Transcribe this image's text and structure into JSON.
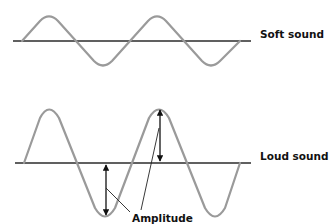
{
  "diagram": {
    "waves": [
      {
        "id": "soft",
        "label": "Soft sound",
        "baseline_y": 41,
        "amplitude_px": 22,
        "cycles": 2,
        "color": "#9a9a9a"
      },
      {
        "id": "loud",
        "label": "Loud sound",
        "baseline_y": 163,
        "amplitude_px": 54,
        "cycles": 2,
        "color": "#9a9a9a"
      }
    ],
    "annotation": {
      "label": "Amplitude",
      "arrow_count": 2
    },
    "colors": {
      "axis": "#2b2b2b",
      "wave": "#9a9a9a",
      "text": "#111111",
      "background": "#ffffff"
    }
  }
}
